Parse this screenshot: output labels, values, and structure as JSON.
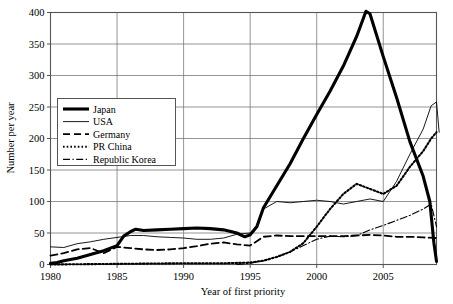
{
  "chart_data": {
    "type": "line",
    "title": "",
    "xlabel": "Year of first priority",
    "ylabel": "Number per year",
    "xlim": [
      1980,
      2009
    ],
    "ylim": [
      0,
      400
    ],
    "xticks": [
      1980,
      1985,
      1990,
      1995,
      2000,
      2005
    ],
    "yticks": [
      0,
      50,
      100,
      150,
      200,
      250,
      300,
      350,
      400
    ],
    "grid": true,
    "legend_position": "upper-left-inside",
    "x": [
      1980,
      1981,
      1982,
      1983,
      1984,
      1985,
      1986,
      1987,
      1988,
      1989,
      1990,
      1991,
      1992,
      1993,
      1994,
      1995,
      1996,
      1997,
      1998,
      1999,
      2000,
      2001,
      2002,
      2003,
      2004,
      2005,
      2006,
      2007,
      2008,
      2009
    ],
    "series": [
      {
        "name": "Japan",
        "style": "thick-solid",
        "values": [
          2,
          5,
          9,
          14,
          20,
          28,
          40,
          55,
          54,
          56,
          57,
          58,
          57,
          54,
          50,
          45,
          52,
          58,
          62,
          60,
          57,
          60,
          59,
          58,
          60,
          57,
          58,
          55,
          53,
          55
        ]
      },
      {
        "name": "USA",
        "style": "thin-solid",
        "values": [
          28,
          27,
          30,
          33,
          36,
          38,
          40,
          42,
          44,
          45,
          44,
          42,
          40,
          38,
          40,
          44,
          60,
          78,
          88,
          96,
          100,
          97,
          95,
          98,
          100,
          99,
          96,
          93,
          90,
          88
        ]
      },
      {
        "name": "Germany",
        "style": "dashed",
        "values": [
          14,
          17,
          22,
          24,
          18,
          26,
          25,
          24,
          23,
          22,
          22,
          23,
          26,
          30,
          33,
          30,
          28,
          32,
          36,
          40,
          42,
          40,
          38,
          37,
          36,
          33,
          36,
          40,
          43,
          44
        ]
      },
      {
        "name": "PR China",
        "style": "dotted",
        "values": [
          0,
          0,
          1,
          1,
          1,
          2,
          2,
          2,
          2,
          2,
          2,
          2,
          2,
          2,
          3,
          3,
          5,
          8,
          12,
          17,
          22,
          26,
          30,
          33,
          34,
          33,
          36,
          40,
          44,
          46
        ]
      },
      {
        "name": "Republic Korea",
        "style": "dash-dot",
        "values": [
          0,
          0,
          0,
          0,
          0,
          0,
          0,
          0,
          0,
          0,
          0,
          0,
          0,
          0,
          1,
          2,
          4,
          6,
          9,
          12,
          14,
          16,
          18,
          20,
          22,
          24,
          26,
          28,
          30,
          32
        ]
      }
    ],
    "series_detailed_path": {
      "note": "Full traced vertices in data coordinates (year, value) per series.",
      "Japan": [
        [
          1980,
          2
        ],
        [
          1980.5,
          3
        ],
        [
          1981,
          6
        ],
        [
          1982,
          10
        ],
        [
          1983,
          16
        ],
        [
          1984,
          22
        ],
        [
          1985,
          30
        ],
        [
          1985.5,
          45
        ],
        [
          1986,
          52
        ],
        [
          1986.4,
          56
        ],
        [
          1987,
          54
        ],
        [
          1988,
          55
        ],
        [
          1989,
          56
        ],
        [
          1990,
          57
        ],
        [
          1991,
          58
        ],
        [
          1992,
          57
        ],
        [
          1993,
          55
        ],
        [
          1994,
          50
        ],
        [
          1994.6,
          44
        ],
        [
          1995,
          47
        ],
        [
          1995.5,
          60
        ],
        [
          1996,
          90
        ],
        [
          1997,
          125
        ],
        [
          1998,
          160
        ],
        [
          1999,
          200
        ],
        [
          2000,
          238
        ],
        [
          2001,
          275
        ],
        [
          2002,
          315
        ],
        [
          2003,
          362
        ],
        [
          2003.7,
          402
        ],
        [
          2004,
          398
        ],
        [
          2005,
          330
        ],
        [
          2006,
          265
        ],
        [
          2007,
          195
        ],
        [
          2008,
          140
        ],
        [
          2008.5,
          100
        ],
        [
          2008.8,
          35
        ],
        [
          2009,
          5
        ]
      ],
      "USA": [
        [
          1980,
          28
        ],
        [
          1981,
          27
        ],
        [
          1982,
          33
        ],
        [
          1983,
          36
        ],
        [
          1984,
          40
        ],
        [
          1985,
          43
        ],
        [
          1986,
          46
        ],
        [
          1987,
          46
        ],
        [
          1988,
          44
        ],
        [
          1989,
          43
        ],
        [
          1990,
          42
        ],
        [
          1991,
          40
        ],
        [
          1992,
          40
        ],
        [
          1993,
          42
        ],
        [
          1994,
          48
        ],
        [
          1995,
          50
        ],
        [
          1995.5,
          62
        ],
        [
          1996,
          88
        ],
        [
          1997,
          100
        ],
        [
          1998,
          98
        ],
        [
          1999,
          100
        ],
        [
          2000,
          102
        ],
        [
          2001,
          100
        ],
        [
          2002,
          96
        ],
        [
          2003,
          100
        ],
        [
          2004,
          104
        ],
        [
          2005,
          100
        ],
        [
          2006,
          132
        ],
        [
          2007,
          175
        ],
        [
          2008,
          215
        ],
        [
          2008.6,
          252
        ],
        [
          2009,
          258
        ],
        [
          2009.2,
          210
        ]
      ],
      "Germany": [
        [
          1980,
          14
        ],
        [
          1981,
          18
        ],
        [
          1982,
          24
        ],
        [
          1983,
          26
        ],
        [
          1984,
          18
        ],
        [
          1985,
          28
        ],
        [
          1986,
          26
        ],
        [
          1987,
          24
        ],
        [
          1988,
          23
        ],
        [
          1989,
          24
        ],
        [
          1990,
          26
        ],
        [
          1991,
          29
        ],
        [
          1992,
          33
        ],
        [
          1993,
          35
        ],
        [
          1994,
          32
        ],
        [
          1995,
          30
        ],
        [
          1996,
          44
        ],
        [
          1997,
          46
        ],
        [
          1998,
          45
        ],
        [
          1999,
          45
        ],
        [
          2000,
          45
        ],
        [
          2001,
          45
        ],
        [
          2002,
          45
        ],
        [
          2003,
          46
        ],
        [
          2004,
          47
        ],
        [
          2005,
          46
        ],
        [
          2006,
          44
        ],
        [
          2007,
          44
        ],
        [
          2008,
          43
        ],
        [
          2009,
          42
        ]
      ],
      "PR China": [
        [
          1980,
          0
        ],
        [
          1985,
          1
        ],
        [
          1990,
          2
        ],
        [
          1993,
          2
        ],
        [
          1995,
          3
        ],
        [
          1996,
          6
        ],
        [
          1997,
          12
        ],
        [
          1998,
          20
        ],
        [
          1999,
          34
        ],
        [
          2000,
          60
        ],
        [
          2001,
          88
        ],
        [
          2002,
          112
        ],
        [
          2003,
          128
        ],
        [
          2004,
          120
        ],
        [
          2005,
          112
        ],
        [
          2006,
          125
        ],
        [
          2007,
          155
        ],
        [
          2008,
          180
        ],
        [
          2008.6,
          200
        ],
        [
          2009,
          210
        ]
      ],
      "Republic Korea": [
        [
          1994,
          0
        ],
        [
          1995,
          2
        ],
        [
          1996,
          6
        ],
        [
          1997,
          12
        ],
        [
          1998,
          20
        ],
        [
          1999,
          30
        ],
        [
          2000,
          40
        ],
        [
          2001,
          45
        ],
        [
          2002,
          44
        ],
        [
          2003,
          46
        ],
        [
          2004,
          55
        ],
        [
          2005,
          62
        ],
        [
          2006,
          70
        ],
        [
          2007,
          78
        ],
        [
          2008,
          88
        ],
        [
          2008.6,
          96
        ],
        [
          2009,
          60
        ]
      ]
    },
    "legend_entries": [
      {
        "label": "Japan",
        "style": "thick-solid"
      },
      {
        "label": "USA",
        "style": "thin-solid"
      },
      {
        "label": "Germany",
        "style": "dashed"
      },
      {
        "label": "PR China",
        "style": "dotted"
      },
      {
        "label": "Republic Korea",
        "style": "dash-dot"
      }
    ]
  },
  "colors": {
    "line": "#000000",
    "grid": "#7a7a7a",
    "frame": "#555555",
    "background": "#ffffff"
  }
}
